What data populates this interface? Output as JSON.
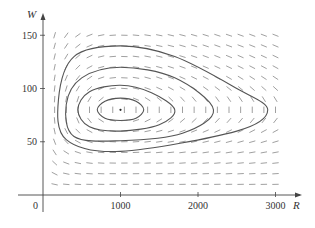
{
  "chart_data": {
    "type": "line",
    "title": "",
    "xlabel": "R",
    "ylabel": "W",
    "xlim": [
      0,
      3200
    ],
    "ylim": [
      0,
      160
    ],
    "x_ticks": [
      1000,
      2000,
      3000
    ],
    "x_tick_labels": [
      "1000",
      "2000",
      "3000"
    ],
    "y_ticks": [
      50,
      100,
      150
    ],
    "y_tick_labels": [
      "50",
      "100",
      "150"
    ],
    "origin_label": "0",
    "grid": false,
    "legend": null,
    "equilibrium": {
      "R": 1000,
      "W": 80
    },
    "direction_field": {
      "R_range": [
        150,
        3000
      ],
      "W_range": [
        10,
        150
      ],
      "R_step": 150,
      "W_step": 10
    },
    "series": [
      {
        "name": "orbit-1",
        "R": [
          700,
          800,
          1000,
          1200,
          1300,
          1200,
          1000,
          800,
          700
        ],
        "W": [
          80,
          88,
          91,
          88,
          80,
          72,
          70,
          72,
          80
        ]
      },
      {
        "name": "orbit-2",
        "R": [
          450,
          600,
          1000,
          1400,
          1700,
          1500,
          1000,
          600,
          450
        ],
        "W": [
          80,
          97,
          103,
          96,
          80,
          66,
          60,
          64,
          80
        ]
      },
      {
        "name": "orbit-3",
        "R": [
          300,
          500,
          1000,
          1700,
          2200,
          1800,
          1000,
          400,
          300
        ],
        "W": [
          85,
          110,
          120,
          110,
          80,
          58,
          51,
          55,
          85
        ]
      },
      {
        "name": "orbit-4",
        "R": [
          200,
          400,
          1000,
          1700,
          2500,
          2900,
          2500,
          1000,
          300,
          200
        ],
        "W": [
          90,
          130,
          140,
          130,
          100,
          80,
          60,
          41,
          52,
          90
        ]
      }
    ]
  }
}
